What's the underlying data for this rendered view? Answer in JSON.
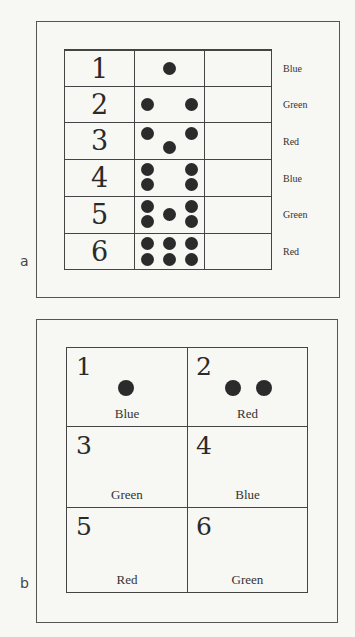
{
  "panel_a": {
    "letter": "a",
    "rows": [
      {
        "number": "1",
        "dots": 1,
        "label": "Blue"
      },
      {
        "number": "2",
        "dots": 2,
        "label": "Green"
      },
      {
        "number": "3",
        "dots": 3,
        "label": "Red"
      },
      {
        "number": "4",
        "dots": 4,
        "label": "Blue"
      },
      {
        "number": "5",
        "dots": 5,
        "label": "Green"
      },
      {
        "number": "6",
        "dots": 6,
        "label": "Red"
      }
    ]
  },
  "panel_b": {
    "letter": "b",
    "cells": [
      {
        "number": "1",
        "dots": 1,
        "label": "Blue"
      },
      {
        "number": "2",
        "dots": 2,
        "label": "Red"
      },
      {
        "number": "3",
        "dots": 0,
        "label": "Green"
      },
      {
        "number": "4",
        "dots": 0,
        "label": "Blue"
      },
      {
        "number": "5",
        "dots": 0,
        "label": "Red"
      },
      {
        "number": "6",
        "dots": 0,
        "label": "Green"
      }
    ]
  },
  "colors": {
    "background": "#f7f7f4",
    "lines": "#444444",
    "dots": "#2b2b2b",
    "text": "#2e2e2e"
  }
}
